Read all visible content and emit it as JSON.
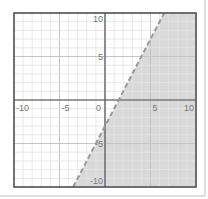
{
  "chart_data": {
    "type": "line",
    "title": "",
    "xlabel": "",
    "ylabel": "",
    "xlim": [
      -10,
      10
    ],
    "ylim": [
      -10,
      10
    ],
    "grid": true,
    "minor_grid_step": 1,
    "major_grid_step": 5,
    "x_tick_labels": [
      "-10",
      "-5",
      "0",
      "5",
      "10"
    ],
    "y_tick_labels": [
      "10",
      "5",
      "-5",
      "-10"
    ],
    "series": [
      {
        "name": "boundary",
        "equation": "y = 2x - 3",
        "style": "dashed",
        "points": [
          [
            -3.5,
            -10
          ],
          [
            1.5,
            0
          ],
          [
            6.5,
            10
          ]
        ]
      }
    ],
    "inequality": "y < 2x - 3",
    "shaded_region": "below-right of boundary line",
    "colors": {
      "shade": "#d9d9d9",
      "boundary": "#999999",
      "axis": "#555555",
      "frame": "#555555",
      "grid_minor": "#e3e3e3",
      "grid_major": "#c4c4c4"
    }
  }
}
